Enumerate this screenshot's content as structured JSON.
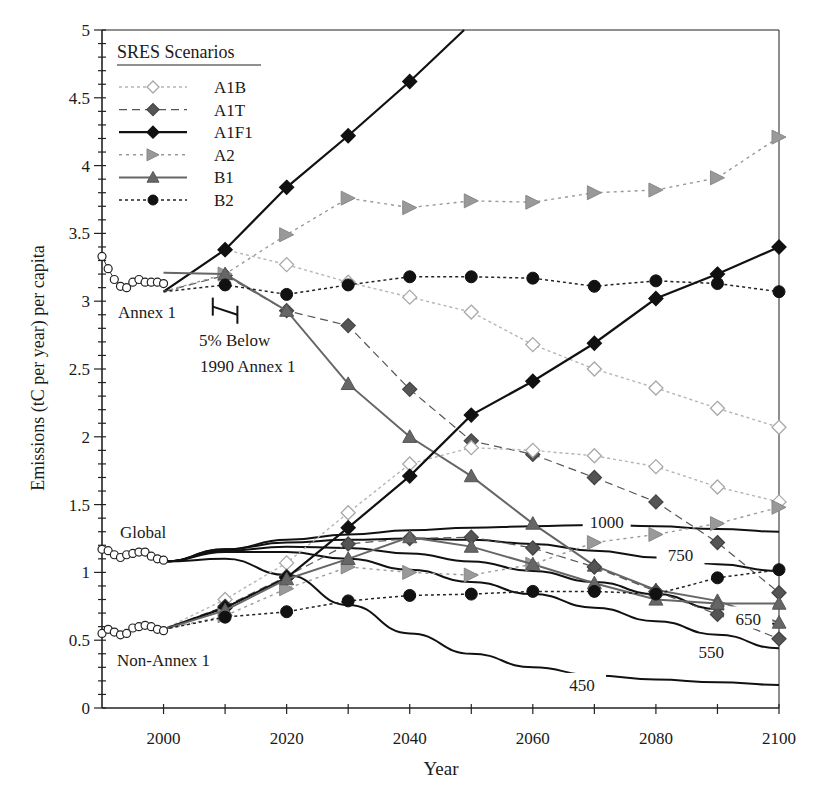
{
  "chart_data": {
    "type": "line",
    "title": "",
    "xlabel": "Year",
    "ylabel": "Emissions (tC per year) per capita",
    "xlim": [
      1990,
      2100
    ],
    "ylim": [
      0,
      5
    ],
    "x_ticks": [
      2000,
      2020,
      2040,
      2060,
      2080,
      2100
    ],
    "y_ticks": [
      "0",
      "0.5",
      "1",
      "1.5",
      "2",
      "2.5",
      "3",
      "3.5",
      "4",
      "4.5",
      "5"
    ],
    "grid": false,
    "legend": {
      "title": "SRES Scenarios",
      "position": "upper-left",
      "entries": [
        "A1B",
        "A1T",
        "A1F1",
        "A2",
        "B1",
        "B2"
      ]
    },
    "x": [
      2000,
      2010,
      2020,
      2030,
      2040,
      2050,
      2060,
      2070,
      2080,
      2090,
      2100
    ],
    "groups": {
      "annex1": {
        "label": "Annex 1",
        "series": [
          {
            "name": "A1B",
            "values": [
              3.07,
              3.38,
              3.27,
              3.14,
              3.03,
              2.92,
              2.68,
              2.5,
              2.36,
              2.21,
              2.07
            ]
          },
          {
            "name": "A1T",
            "values": [
              3.07,
              3.19,
              2.93,
              2.82,
              2.35,
              1.97,
              1.87,
              1.7,
              1.52,
              1.22,
              0.85
            ]
          },
          {
            "name": "A1F1",
            "values": [
              3.07,
              3.38,
              3.84,
              4.22,
              4.62,
              5.05,
              null,
              null,
              null,
              null,
              null
            ]
          },
          {
            "name": "A2",
            "values": [
              3.07,
              3.2,
              3.49,
              3.76,
              3.69,
              3.74,
              3.73,
              3.8,
              3.82,
              3.91,
              4.21
            ]
          },
          {
            "name": "B1",
            "values": [
              3.21,
              3.2,
              2.93,
              2.39,
              2.0,
              1.71,
              1.36,
              1.05,
              0.87,
              0.79,
              0.63
            ]
          },
          {
            "name": "B2",
            "values": [
              3.07,
              3.12,
              3.05,
              3.12,
              3.18,
              3.18,
              3.17,
              3.11,
              3.15,
              3.13,
              3.07
            ]
          }
        ]
      },
      "non_annex1": {
        "label": "Non-Annex 1",
        "series": [
          {
            "name": "A1B",
            "values": [
              0.58,
              0.8,
              1.07,
              1.44,
              1.8,
              1.92,
              1.9,
              1.86,
              1.78,
              1.63,
              1.52
            ]
          },
          {
            "name": "A1T",
            "values": [
              0.58,
              0.75,
              0.97,
              1.21,
              1.25,
              1.26,
              1.18,
              1.04,
              0.86,
              0.69,
              0.51
            ]
          },
          {
            "name": "A1F1",
            "values": [
              0.58,
              0.74,
              0.96,
              1.33,
              1.71,
              2.16,
              2.41,
              2.69,
              3.02,
              3.2,
              3.4
            ]
          },
          {
            "name": "A2",
            "values": [
              0.58,
              0.68,
              0.88,
              1.04,
              1.0,
              0.98,
              1.06,
              1.22,
              1.28,
              1.36,
              1.48
            ]
          },
          {
            "name": "B1",
            "values": [
              0.58,
              0.72,
              0.95,
              1.1,
              1.26,
              1.19,
              1.06,
              0.92,
              0.8,
              0.77,
              0.77
            ]
          },
          {
            "name": "B2",
            "values": [
              0.58,
              0.67,
              0.71,
              0.79,
              0.83,
              0.84,
              0.86,
              0.86,
              0.84,
              0.96,
              1.02
            ]
          }
        ]
      }
    },
    "historical": {
      "x": [
        1990,
        1991,
        1992,
        1993,
        1994,
        1995,
        1996,
        1997,
        1998,
        1999,
        2000
      ],
      "annex1": [
        3.33,
        3.24,
        3.16,
        3.11,
        3.1,
        3.14,
        3.16,
        3.14,
        3.14,
        3.14,
        3.13
      ],
      "global": [
        1.17,
        1.16,
        1.13,
        1.11,
        1.13,
        1.14,
        1.15,
        1.15,
        1.12,
        1.1,
        1.09
      ],
      "non_annex1": [
        0.55,
        0.58,
        0.56,
        0.54,
        0.55,
        0.59,
        0.6,
        0.61,
        0.6,
        0.58,
        0.57
      ]
    },
    "stabilization": {
      "label": "Global",
      "x": [
        2000,
        2010,
        2020,
        2030,
        2040,
        2050,
        2060,
        2070,
        2080,
        2090,
        2100
      ],
      "curves": [
        {
          "name": "1000",
          "values": [
            1.08,
            1.17,
            1.24,
            1.28,
            1.31,
            1.33,
            1.34,
            1.35,
            1.34,
            1.32,
            1.3
          ]
        },
        {
          "name": "750",
          "values": [
            1.08,
            1.17,
            1.22,
            1.24,
            1.25,
            1.24,
            1.21,
            1.16,
            1.11,
            1.06,
            1.01
          ]
        },
        {
          "name": "650",
          "values": [
            1.08,
            1.16,
            1.19,
            1.18,
            1.14,
            1.08,
            1.01,
            0.93,
            0.84,
            0.73,
            0.62
          ]
        },
        {
          "name": "550",
          "values": [
            1.08,
            1.15,
            1.15,
            1.1,
            1.02,
            0.93,
            0.84,
            0.74,
            0.64,
            0.54,
            0.44
          ]
        },
        {
          "name": "450",
          "values": [
            1.08,
            1.1,
            0.98,
            0.76,
            0.55,
            0.4,
            0.3,
            0.24,
            0.21,
            0.19,
            0.17
          ]
        }
      ]
    },
    "annotations": [
      {
        "text": "Annex 1",
        "x": 1992,
        "y": 2.92
      },
      {
        "text": "5% Below",
        "x": 2009,
        "y": 2.65
      },
      {
        "text": "1990 Annex 1",
        "x": 2007,
        "y": 2.43
      },
      {
        "text": "Global",
        "x": 1992,
        "y": 1.35
      },
      {
        "text": "Non-Annex 1",
        "x": 1992,
        "y": 0.35
      },
      {
        "text": "1000",
        "x": 2072,
        "y": 1.37
      },
      {
        "text": "750",
        "x": 2084,
        "y": 1.13
      },
      {
        "text": "650",
        "x": 2095,
        "y": 0.66
      },
      {
        "text": "550",
        "x": 2089,
        "y": 0.41
      },
      {
        "text": "450",
        "x": 2068,
        "y": 0.17
      }
    ],
    "kyoto_target": {
      "x": [
        2008,
        2012
      ],
      "y": [
        2.96,
        2.9
      ]
    }
  },
  "labels": {
    "xlabel": "Year",
    "ylabel": "Emissions (tC per year) per capita",
    "legend_title": "SRES Scenarios",
    "annex1": "Annex 1",
    "five_below": "5% Below",
    "below_1990": "1990 Annex 1",
    "global": "Global",
    "non_annex1": "Non-Annex 1"
  }
}
